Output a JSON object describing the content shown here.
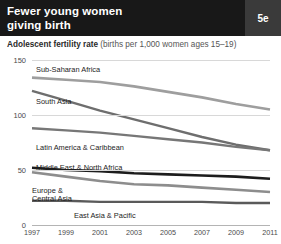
{
  "header": {
    "title": "Fewer young women\ngiving birth",
    "badge": "5e",
    "bg_color": "#181818",
    "badge_color": "#3a3a3a"
  },
  "subtitle": {
    "bold": "Adolescent fertility rate",
    "rest": " (births per 1,000 women ages 15–19)"
  },
  "chart_data": {
    "type": "line",
    "title": "Fewer young women giving birth",
    "subtitle": "Adolescent fertility rate (births per 1,000 women ages 15–19)",
    "xlabel": "",
    "ylabel": "",
    "x": [
      1997,
      1999,
      2001,
      2003,
      2005,
      2007,
      2009,
      2011
    ],
    "tick_labels": [
      "1997",
      "1999",
      "2001",
      "2003",
      "2005",
      "2007",
      "2009",
      "2011"
    ],
    "ylim": [
      0,
      150
    ],
    "yticks": [
      0,
      50,
      100,
      150
    ],
    "ytick_labels": [
      "0",
      "50",
      "100",
      "150"
    ],
    "grid": true,
    "legend": "inline-labels",
    "series": [
      {
        "name": "Sub-Saharan Africa",
        "color": "#9e9e9e",
        "width": 2.6,
        "values": [
          134,
          132,
          130,
          126,
          121,
          116,
          110,
          105
        ],
        "label_x": 4,
        "label_y": 6
      },
      {
        "name": "South Asia",
        "color": "#6e6e6e",
        "width": 2.4,
        "values": [
          122,
          113,
          104,
          96,
          88,
          80,
          73,
          68
        ],
        "label_x": 4,
        "label_y": 38
      },
      {
        "name": "Latin America & Caribbean",
        "color": "#777777",
        "width": 2.4,
        "values": [
          88,
          86,
          84,
          81,
          78,
          75,
          71,
          68
        ],
        "label_x": 4,
        "label_y": 84
      },
      {
        "name": "Middle East & North Africa",
        "color": "#1d1d1d",
        "width": 2.6,
        "values": [
          52,
          50,
          49,
          47,
          46,
          45,
          44,
          42
        ],
        "label_x": 4,
        "label_y": 104
      },
      {
        "name": "Europe &\nCentral Asia",
        "color": "#8d8d8d",
        "width": 2.6,
        "values": [
          48,
          44,
          40,
          37,
          36,
          34,
          32,
          30
        ],
        "label_x": 0,
        "label_y": 127
      },
      {
        "name": "East Asia & Pacific",
        "color": "#5a5a5a",
        "width": 2.4,
        "values": [
          22,
          22,
          21,
          21,
          21,
          21,
          20,
          20
        ],
        "label_x": 42,
        "label_y": 152
      }
    ]
  }
}
